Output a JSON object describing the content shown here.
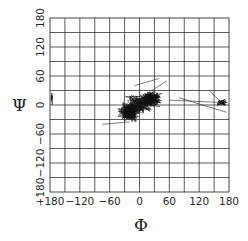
{
  "chart_data": {
    "type": "line",
    "subtype": "ramachandran-trajectory",
    "title": "",
    "xlabel": "Φ",
    "ylabel": "Ψ",
    "xlim": [
      -180,
      180
    ],
    "ylim": [
      -180,
      180
    ],
    "grid": true,
    "grid_step": 30,
    "x_ticks": [
      -180,
      -120,
      -60,
      0,
      60,
      120,
      180
    ],
    "y_ticks": [
      -180,
      -120,
      -60,
      0,
      60,
      120,
      180
    ],
    "x_tick_labels": [
      "-180",
      "-120",
      "-60",
      "0",
      "60",
      "120",
      "180"
    ],
    "y_tick_labels": [
      "-180",
      "-120",
      "-60",
      "0",
      "60",
      "120",
      "180"
    ],
    "legend": null,
    "line_color": "#111111",
    "clusters": [
      {
        "name": "main-alpha-region",
        "phi_range": [
          -70,
          60
        ],
        "psi_range": [
          -65,
          45
        ],
        "center": [
          -10,
          0
        ],
        "density": "very high"
      },
      {
        "name": "right-edge-region",
        "phi_range": [
          140,
          180
        ],
        "psi_range": [
          -10,
          25
        ],
        "center": [
          165,
          8
        ],
        "density": "medium"
      },
      {
        "name": "left-edge-wrap-region",
        "phi_range": [
          -180,
          -170
        ],
        "psi_range": [
          0,
          50
        ],
        "center": [
          -177,
          15
        ],
        "density": "low"
      }
    ],
    "notable_segments": [
      {
        "from": [
          -75,
          -40
        ],
        "to": [
          -20,
          -35
        ]
      },
      {
        "from": [
          -10,
          40
        ],
        "to": [
          40,
          55
        ]
      },
      {
        "from": [
          25,
          30
        ],
        "to": [
          55,
          50
        ]
      },
      {
        "from": [
          60,
          10
        ],
        "to": [
          170,
          5
        ]
      },
      {
        "from": [
          140,
          30
        ],
        "to": [
          170,
          0
        ]
      },
      {
        "from": [
          80,
          15
        ],
        "to": [
          175,
          -15
        ]
      }
    ]
  },
  "axes": {
    "x_label": "Φ",
    "y_label": "Ψ",
    "corner_mark": "'"
  }
}
